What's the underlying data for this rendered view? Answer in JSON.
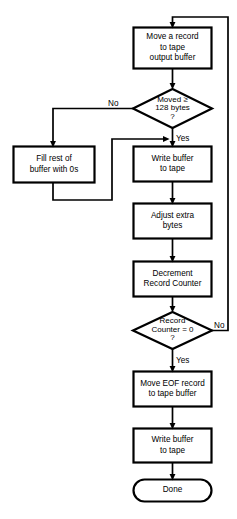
{
  "diagram": {
    "stroke_color": "#000000",
    "fill_color": "#ffffff",
    "background": "#ffffff"
  },
  "nodes": {
    "move_record": {
      "label": "Move a record\nto tape\noutput buffer",
      "shape": "process"
    },
    "moved_128": {
      "label": "Moved  ≥\n128 bytes\n?",
      "shape": "decision"
    },
    "fill_zeros": {
      "label": "Fill rest of\nbuffer with 0s",
      "shape": "process"
    },
    "write_buffer_1": {
      "label": "Write buffer\nto tape",
      "shape": "process"
    },
    "adjust_extra": {
      "label": "Adjust extra\nbytes",
      "shape": "process"
    },
    "decrement_counter": {
      "label": "Decrement\nRecord Counter",
      "shape": "process"
    },
    "counter_zero": {
      "label": "Record\nCounter = 0\n?",
      "shape": "decision"
    },
    "move_eof": {
      "label": "Move EOF record\nto tape buffer",
      "shape": "process"
    },
    "write_buffer_2": {
      "label": "Write buffer\nto tape",
      "shape": "process"
    },
    "done": {
      "label": "Done",
      "shape": "terminal"
    }
  },
  "edge_labels": {
    "moved_no": "No",
    "moved_yes": "Yes",
    "counter_no": "No",
    "counter_yes": "Yes"
  }
}
